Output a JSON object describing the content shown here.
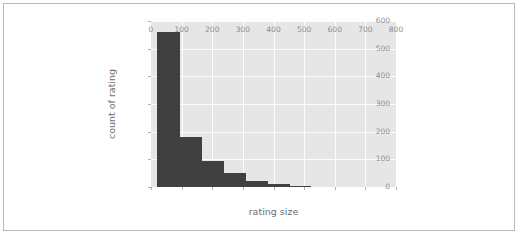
{
  "figure": {
    "background_color": "#ffffff",
    "border_color": "#b9b9b9",
    "plot_background_color": "#e6e6e6",
    "grid_color": "#fdfdfd",
    "bar_color": "#404040",
    "tick_label_color": "#8d8d8d",
    "axis_label_color": "#6e6e6e"
  },
  "chart_data": {
    "type": "bar",
    "title": "",
    "xlabel": "rating size",
    "ylabel": "count of rating",
    "xlim": [
      0,
      800
    ],
    "ylim": [
      0,
      600
    ],
    "grid": true,
    "legend": false,
    "xticks": [
      0,
      100,
      200,
      300,
      400,
      500,
      600,
      700,
      800
    ],
    "xtick_labels": [
      "0",
      "100",
      "200",
      "300",
      "400",
      "500",
      "600",
      "700",
      "800"
    ],
    "yticks": [
      0,
      100,
      200,
      300,
      400,
      500,
      600
    ],
    "ytick_labels": [
      "0",
      "100",
      "200",
      "300",
      "400",
      "500",
      "600"
    ],
    "bins": [
      {
        "x0": 20,
        "x1": 95,
        "value": 560
      },
      {
        "x0": 95,
        "x1": 167,
        "value": 180
      },
      {
        "x0": 167,
        "x1": 239,
        "value": 95
      },
      {
        "x0": 239,
        "x1": 310,
        "value": 50
      },
      {
        "x0": 310,
        "x1": 382,
        "value": 20
      },
      {
        "x0": 382,
        "x1": 453,
        "value": 12
      },
      {
        "x0": 453,
        "x1": 522,
        "value": 3
      }
    ],
    "categories": [
      "20-95",
      "95-167",
      "167-239",
      "239-310",
      "310-382",
      "382-453",
      "453-522"
    ],
    "values": [
      560,
      180,
      95,
      50,
      20,
      12,
      3
    ]
  }
}
